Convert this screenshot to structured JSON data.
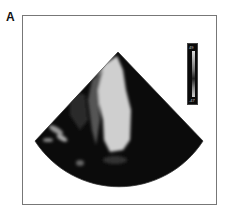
{
  "panel": {
    "label": "A"
  },
  "colorbar": {
    "top_label": "49",
    "bottom_label": "-47"
  },
  "colors": {
    "background": "#ffffff",
    "sector": "#0b0b0b",
    "tissue": "#cfcfcf",
    "frame": "#777777"
  }
}
